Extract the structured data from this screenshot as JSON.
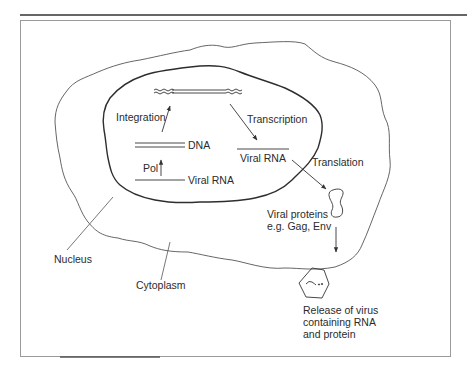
{
  "figure": {
    "regions": {
      "nucleus_label": "Nucleus",
      "cytoplasm_label": "Cytoplasm"
    },
    "nucleus_steps": {
      "integration_label": "Integration",
      "transcription_label": "Transcription",
      "dna_label": "DNA",
      "pol_label": "Pol",
      "viral_rna_label": "Viral RNA",
      "transcribed_rna_label": "Viral RNA"
    },
    "cytoplasm_steps": {
      "translation_label": "Translation",
      "proteins_line1": "Viral proteins",
      "proteins_line2": "e.g. Gag, Env",
      "release_line1": "Release of virus",
      "release_line2": "containing RNA",
      "release_line3": "and protein"
    },
    "colors": {
      "line": "#333333",
      "frame": "#9a9a9a",
      "text": "#2b2b2b"
    }
  }
}
